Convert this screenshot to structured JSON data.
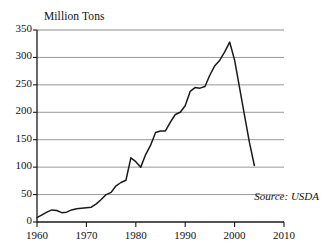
{
  "chart_data": {
    "type": "line",
    "title": "Million Tons",
    "xlabel": "",
    "ylabel": "Million Tons",
    "xlim": [
      1960,
      2010
    ],
    "ylim": [
      0,
      350
    ],
    "grid": true,
    "grid_axis": "y",
    "legend": "none",
    "annotation": "Source: USDA",
    "y_ticks": [
      0,
      50,
      100,
      150,
      200,
      250,
      300,
      350
    ],
    "y_tick_labels": [
      "0",
      "50",
      "100",
      "150",
      "200",
      "250",
      "300",
      "350"
    ],
    "x_ticks": [
      1960,
      1970,
      1980,
      1990,
      2000,
      2010
    ],
    "x_tick_labels": [
      "1960",
      "1970",
      "1980",
      "1990",
      "2000",
      "2010"
    ],
    "series": [
      {
        "name": "Production",
        "color": "#1a1a1a",
        "x": [
          1960,
          1961,
          1962,
          1963,
          1964,
          1965,
          1966,
          1967,
          1968,
          1969,
          1970,
          1971,
          1972,
          1973,
          1974,
          1975,
          1976,
          1977,
          1978,
          1979,
          1980,
          1981,
          1982,
          1983,
          1984,
          1985,
          1986,
          1987,
          1988,
          1989,
          1990,
          1991,
          1992,
          1993,
          1994,
          1995,
          1996,
          1997,
          1998,
          1999,
          2000,
          2001,
          2002,
          2003,
          2004
        ],
        "y": [
          8,
          13,
          18,
          22,
          21,
          17,
          18,
          22,
          24,
          25,
          26,
          27,
          33,
          41,
          50,
          54,
          66,
          72,
          76,
          117,
          110,
          100,
          123,
          140,
          163,
          166,
          166,
          182,
          196,
          200,
          212,
          238,
          245,
          244,
          247,
          268,
          285,
          295,
          310,
          328,
          295,
          245,
          195,
          145,
          103
        ]
      }
    ]
  },
  "axes": {
    "y_label_positions": [
      30,
      57.4,
      84.9,
      112.3,
      139.7,
      167.1,
      194.6,
      222
    ],
    "x_label_positions": [
      37,
      86.4,
      135.8,
      185.2,
      234.6,
      284
    ]
  }
}
